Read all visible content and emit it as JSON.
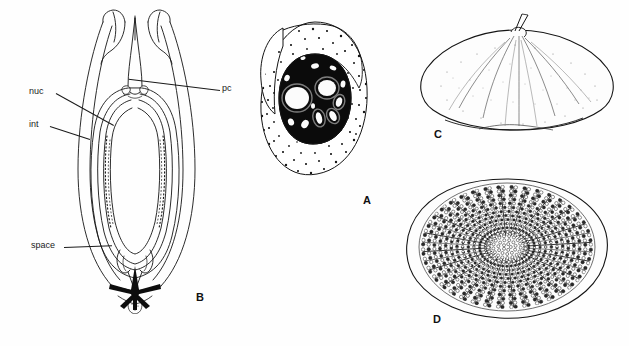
{
  "figure": {
    "background_color": "#fefefe",
    "ink_color": "#111111",
    "width": 629,
    "height": 346,
    "panels": [
      {
        "letter": "A",
        "name": "stippled-oval-section",
        "description": "Oval body with dense stipple cortex enclosing a dark central mass containing pale inclusions"
      },
      {
        "letter": "B",
        "name": "bivalved-longitudinal-section",
        "description": "Longitudinal section with two recurved apical horns, concentric inner walls and a dark basal star"
      },
      {
        "letter": "C",
        "name": "dome-lateral-view",
        "description": "Low dome in lateral view with faint radial ribs and an apical spine"
      },
      {
        "letter": "D",
        "name": "radial-rosette-apical-view",
        "description": "Rounded disc in apical view with radiating rows of tubercles around a granular centre"
      }
    ],
    "annotations": [
      {
        "id": "nuc",
        "text": "nuc",
        "panel": "B"
      },
      {
        "id": "int",
        "text": "int",
        "panel": "B"
      },
      {
        "id": "space",
        "text": "space",
        "panel": "B"
      },
      {
        "id": "pc",
        "text": "pc",
        "panel": "B"
      }
    ]
  }
}
